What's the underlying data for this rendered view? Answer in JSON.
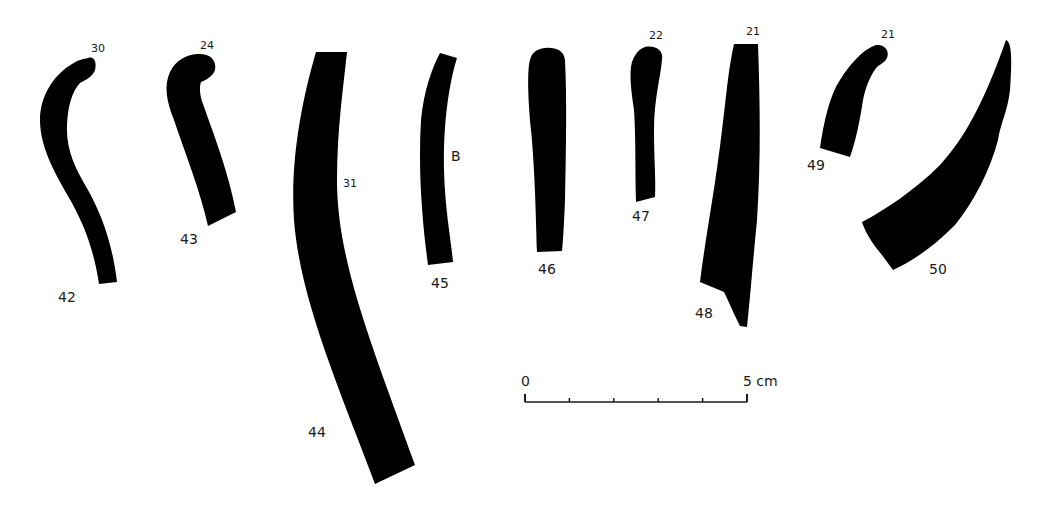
{
  "figure": {
    "ink_color": "#000000",
    "background": "#ffffff",
    "fragments": [
      {
        "number": "42",
        "note": "30"
      },
      {
        "number": "43",
        "note": "24"
      },
      {
        "number": "44",
        "note": "31"
      },
      {
        "number": "45",
        "note": "B"
      },
      {
        "number": "46",
        "note": ""
      },
      {
        "number": "47",
        "note": "22"
      },
      {
        "number": "48",
        "note": "21"
      },
      {
        "number": "49",
        "note": "21"
      },
      {
        "number": "50",
        "note": ""
      }
    ],
    "scale_bar": {
      "start_label": "0",
      "end_label": "5 cm",
      "divisions": 5
    }
  }
}
